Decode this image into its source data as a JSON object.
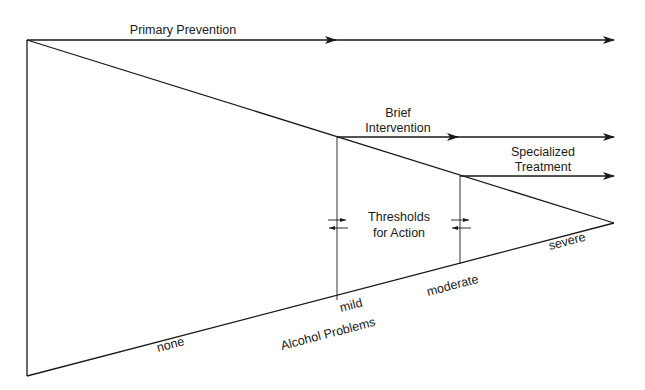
{
  "diagram": {
    "arrows": {
      "primary_prevention": "Primary Prevention",
      "brief_intervention_line1": "Brief",
      "brief_intervention_line2": "Intervention",
      "specialized_treatment_line1": "Specialized",
      "specialized_treatment_line2": "Treatment"
    },
    "thresholds": {
      "line1": "Thresholds",
      "line2": "for Action"
    },
    "severity_scale": {
      "axis_label": "Alcohol Problems",
      "levels": [
        "none",
        "mild",
        "moderate",
        "severe"
      ]
    },
    "colors": {
      "line": "#1a1a1a",
      "background": "#ffffff"
    }
  }
}
